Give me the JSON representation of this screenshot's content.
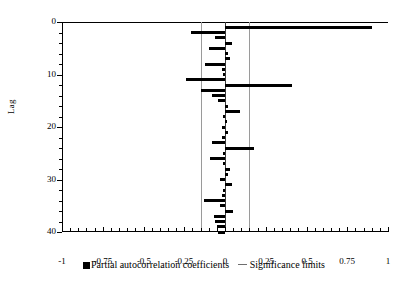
{
  "chart_data": {
    "type": "bar",
    "orientation": "horizontal",
    "title": "",
    "xlabel": "",
    "ylabel": "Lag",
    "xlim": [
      -1,
      1
    ],
    "ylim": [
      0,
      40
    ],
    "grid": false,
    "x_ticks": [
      "-1",
      "-0.75",
      "-0.5",
      "-0.25",
      "0",
      "0.25",
      "0.5",
      "0.75",
      "1"
    ],
    "x_tick_values": [
      -1,
      -0.75,
      -0.5,
      -0.25,
      0,
      0.25,
      0.5,
      0.75,
      1
    ],
    "y_ticks": [
      "0",
      "10",
      "20",
      "30",
      "40"
    ],
    "y_tick_values": [
      0,
      10,
      20,
      30,
      40
    ],
    "significance_limits": [
      -0.147,
      0.147
    ],
    "legend_position": "bottom",
    "legend": [
      {
        "label": "Partial autocorrelation coefficients",
        "marker": "square",
        "color": "#000000"
      },
      {
        "label": "Significance limits",
        "marker": "line",
        "color": "#6e6e6e"
      }
    ],
    "series": [
      {
        "name": "Partial autocorrelation coefficients",
        "color": "#000000",
        "categories": [
          1,
          2,
          3,
          4,
          5,
          6,
          7,
          8,
          9,
          10,
          11,
          12,
          13,
          14,
          15,
          16,
          17,
          18,
          19,
          20,
          21,
          22,
          23,
          24,
          25,
          26,
          27,
          28,
          29,
          30,
          31,
          32,
          33,
          34,
          35,
          36,
          37,
          38,
          39,
          40
        ],
        "values": [
          0.9,
          -0.21,
          -0.06,
          0.04,
          -0.1,
          0.02,
          0.03,
          -0.12,
          -0.02,
          -0.01,
          -0.24,
          0.41,
          -0.15,
          -0.08,
          -0.04,
          0.02,
          0.09,
          -0.01,
          0.01,
          -0.02,
          0.02,
          -0.02,
          -0.08,
          0.18,
          -0.01,
          -0.09,
          -0.01,
          0.03,
          0.02,
          -0.03,
          0.04,
          -0.01,
          -0.02,
          -0.13,
          -0.03,
          0.05,
          -0.07,
          -0.06,
          -0.05,
          -0.04
        ]
      }
    ]
  }
}
